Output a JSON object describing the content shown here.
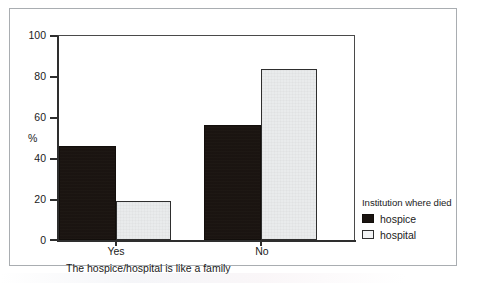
{
  "chart_data": {
    "type": "bar",
    "title": "",
    "subtitle": "",
    "xlabel": "The hospice/hospital is like a family",
    "ylabel": "%",
    "ylim": [
      0,
      100
    ],
    "yticks": [
      0,
      20,
      40,
      60,
      80,
      100
    ],
    "grid": false,
    "legend_position": "right",
    "legend_title": "Institution where died",
    "categories": [
      "Yes",
      "No"
    ],
    "series": [
      {
        "name": "hospice",
        "values": [
          46,
          56
        ],
        "color": "#1a1410"
      },
      {
        "name": "hospital",
        "values": [
          19,
          83.5
        ],
        "color": "#e9ebec"
      }
    ]
  },
  "axes": {
    "y_title": "%",
    "y_tick_labels": [
      "100",
      "80",
      "60",
      "40",
      "20",
      "0"
    ],
    "x_tick_labels": [
      "Yes",
      "No"
    ],
    "caption": "The hospice/hospital is like a family"
  },
  "legend": {
    "title": "Institution where died",
    "entries": [
      {
        "label": "hospice"
      },
      {
        "label": "hospital"
      }
    ]
  }
}
